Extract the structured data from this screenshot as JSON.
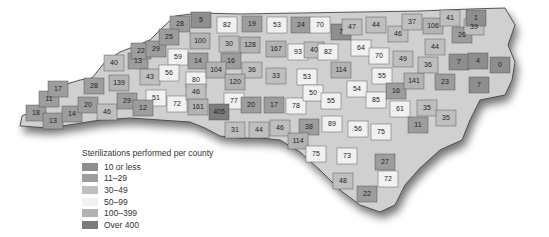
{
  "map": {
    "title": "Sterilizations performed per county",
    "region": "North Carolina",
    "legend": [
      {
        "label": "10 or less",
        "color": "#8e8e8e"
      },
      {
        "label": "11–29",
        "color": "#9d9d9d"
      },
      {
        "label": "30–49",
        "color": "#bfbfbf"
      },
      {
        "label": "50–99",
        "color": "#f1f1f1"
      },
      {
        "label": "100–399",
        "color": "#b3b3b3"
      },
      {
        "label": "Over 400",
        "color": "#7c7c7c"
      }
    ],
    "counties": [
      {
        "value": "18",
        "x": 36,
        "y": 113,
        "cls": 1
      },
      {
        "value": "11",
        "x": 49,
        "y": 99,
        "cls": 1
      },
      {
        "value": "17",
        "x": 58,
        "y": 89,
        "cls": 1
      },
      {
        "value": "13",
        "x": 53,
        "y": 121,
        "cls": 1
      },
      {
        "value": "14",
        "x": 72,
        "y": 114,
        "cls": 1
      },
      {
        "value": "28",
        "x": 94,
        "y": 86,
        "cls": 1
      },
      {
        "value": "20",
        "x": 88,
        "y": 105,
        "cls": 1
      },
      {
        "value": "46",
        "x": 107,
        "y": 112,
        "cls": 2
      },
      {
        "value": "40",
        "x": 114,
        "y": 63,
        "cls": 2
      },
      {
        "value": "139",
        "x": 119,
        "y": 83,
        "cls": 4
      },
      {
        "value": "29",
        "x": 127,
        "y": 101,
        "cls": 1
      },
      {
        "value": "13",
        "x": 138,
        "y": 61,
        "cls": 1
      },
      {
        "value": "22",
        "x": 141,
        "y": 51,
        "cls": 1
      },
      {
        "value": "29",
        "x": 156,
        "y": 49,
        "cls": 1
      },
      {
        "value": "43",
        "x": 150,
        "y": 77,
        "cls": 2
      },
      {
        "value": "28",
        "x": 180,
        "y": 24,
        "cls": 1
      },
      {
        "value": "25",
        "x": 169,
        "y": 37,
        "cls": 1
      },
      {
        "value": "5",
        "x": 201,
        "y": 20,
        "cls": 0
      },
      {
        "value": "100",
        "x": 200,
        "y": 41,
        "cls": 4
      },
      {
        "value": "59",
        "x": 178,
        "y": 57,
        "cls": 3
      },
      {
        "value": "56",
        "x": 169,
        "y": 73,
        "cls": 3
      },
      {
        "value": "14",
        "x": 198,
        "y": 61,
        "cls": 1
      },
      {
        "value": "51",
        "x": 156,
        "y": 98,
        "cls": 3
      },
      {
        "value": "12",
        "x": 143,
        "y": 108,
        "cls": 1
      },
      {
        "value": "72",
        "x": 177,
        "y": 104,
        "cls": 3
      },
      {
        "value": "80",
        "x": 196,
        "y": 80,
        "cls": 3
      },
      {
        "value": "46",
        "x": 196,
        "y": 92,
        "cls": 2
      },
      {
        "value": "161",
        "x": 198,
        "y": 107,
        "cls": 4
      },
      {
        "value": "82",
        "x": 227,
        "y": 25,
        "cls": 3
      },
      {
        "value": "30",
        "x": 229,
        "y": 44,
        "cls": 2
      },
      {
        "value": "19",
        "x": 252,
        "y": 24,
        "cls": 1
      },
      {
        "value": "128",
        "x": 250,
        "y": 45,
        "cls": 4
      },
      {
        "value": "16",
        "x": 231,
        "y": 61,
        "cls": 1
      },
      {
        "value": "104",
        "x": 216,
        "y": 70,
        "cls": 4
      },
      {
        "value": "36",
        "x": 252,
        "y": 70,
        "cls": 2
      },
      {
        "value": "120",
        "x": 235,
        "y": 82,
        "cls": 4
      },
      {
        "value": "53",
        "x": 277,
        "y": 25,
        "cls": 3
      },
      {
        "value": "167",
        "x": 276,
        "y": 49,
        "cls": 4
      },
      {
        "value": "33",
        "x": 276,
        "y": 76,
        "cls": 2
      },
      {
        "value": "24",
        "x": 301,
        "y": 25,
        "cls": 1
      },
      {
        "value": "70",
        "x": 320,
        "y": 25,
        "cls": 3
      },
      {
        "value": "93",
        "x": 298,
        "y": 52,
        "cls": 3
      },
      {
        "value": "40",
        "x": 314,
        "y": 50,
        "cls": 2
      },
      {
        "value": "82",
        "x": 328,
        "y": 52,
        "cls": 3
      },
      {
        "value": "53",
        "x": 307,
        "y": 77,
        "cls": 3
      },
      {
        "value": "7",
        "x": 341,
        "y": 32,
        "cls": 0
      },
      {
        "value": "47",
        "x": 352,
        "y": 27,
        "cls": 2
      },
      {
        "value": "44",
        "x": 376,
        "y": 25,
        "cls": 2
      },
      {
        "value": "64",
        "x": 361,
        "y": 48,
        "cls": 3
      },
      {
        "value": "114",
        "x": 341,
        "y": 70,
        "cls": 4
      },
      {
        "value": "70",
        "x": 379,
        "y": 56,
        "cls": 3
      },
      {
        "value": "46",
        "x": 398,
        "y": 34,
        "cls": 2
      },
      {
        "value": "37",
        "x": 412,
        "y": 22,
        "cls": 2
      },
      {
        "value": "49",
        "x": 403,
        "y": 59,
        "cls": 2
      },
      {
        "value": "55",
        "x": 382,
        "y": 76,
        "cls": 3
      },
      {
        "value": "54",
        "x": 357,
        "y": 89,
        "cls": 3
      },
      {
        "value": "16",
        "x": 396,
        "y": 91,
        "cls": 1
      },
      {
        "value": "141",
        "x": 414,
        "y": 81,
        "cls": 4
      },
      {
        "value": "85",
        "x": 376,
        "y": 100,
        "cls": 3
      },
      {
        "value": "61",
        "x": 400,
        "y": 109,
        "cls": 3
      },
      {
        "value": "35",
        "x": 427,
        "y": 108,
        "cls": 2
      },
      {
        "value": "11",
        "x": 418,
        "y": 125,
        "cls": 1
      },
      {
        "value": "106",
        "x": 433,
        "y": 26,
        "cls": 4
      },
      {
        "value": "41",
        "x": 450,
        "y": 18,
        "cls": 2
      },
      {
        "value": "44",
        "x": 435,
        "y": 47,
        "cls": 2
      },
      {
        "value": "36",
        "x": 428,
        "y": 65,
        "cls": 2
      },
      {
        "value": "23",
        "x": 445,
        "y": 82,
        "cls": 1
      },
      {
        "value": "35",
        "x": 446,
        "y": 118,
        "cls": 2
      },
      {
        "value": "7",
        "x": 459,
        "y": 62,
        "cls": 0
      },
      {
        "value": "26",
        "x": 462,
        "y": 35,
        "cls": 1
      },
      {
        "value": "39",
        "x": 474,
        "y": 27,
        "cls": 2
      },
      {
        "value": "1",
        "x": 476,
        "y": 18,
        "cls": 0
      },
      {
        "value": "4",
        "x": 478,
        "y": 61,
        "cls": 0
      },
      {
        "value": "0",
        "x": 500,
        "y": 65,
        "cls": 0
      },
      {
        "value": "7",
        "x": 479,
        "y": 85,
        "cls": 0
      },
      {
        "value": "77",
        "x": 234,
        "y": 101,
        "cls": 3
      },
      {
        "value": "405",
        "x": 219,
        "y": 112,
        "cls": 5
      },
      {
        "value": "20",
        "x": 251,
        "y": 105,
        "cls": 1
      },
      {
        "value": "17",
        "x": 274,
        "y": 105,
        "cls": 1
      },
      {
        "value": "31",
        "x": 235,
        "y": 130,
        "cls": 2
      },
      {
        "value": "44",
        "x": 259,
        "y": 130,
        "cls": 2
      },
      {
        "value": "46",
        "x": 280,
        "y": 128,
        "cls": 2
      },
      {
        "value": "78",
        "x": 296,
        "y": 106,
        "cls": 3
      },
      {
        "value": "50",
        "x": 313,
        "y": 93,
        "cls": 3
      },
      {
        "value": "55",
        "x": 331,
        "y": 101,
        "cls": 3
      },
      {
        "value": "38",
        "x": 309,
        "y": 127,
        "cls": 1
      },
      {
        "value": "114",
        "x": 298,
        "y": 141,
        "cls": 4
      },
      {
        "value": "89",
        "x": 332,
        "y": 124,
        "cls": 3
      },
      {
        "value": "56",
        "x": 358,
        "y": 129,
        "cls": 3
      },
      {
        "value": "75",
        "x": 381,
        "y": 132,
        "cls": 3
      },
      {
        "value": "75",
        "x": 316,
        "y": 154,
        "cls": 3
      },
      {
        "value": "73",
        "x": 347,
        "y": 156,
        "cls": 3
      },
      {
        "value": "27",
        "x": 385,
        "y": 162,
        "cls": 1
      },
      {
        "value": "48",
        "x": 343,
        "y": 181,
        "cls": 2
      },
      {
        "value": "72",
        "x": 388,
        "y": 179,
        "cls": 3
      },
      {
        "value": "22",
        "x": 367,
        "y": 194,
        "cls": 1
      }
    ]
  }
}
